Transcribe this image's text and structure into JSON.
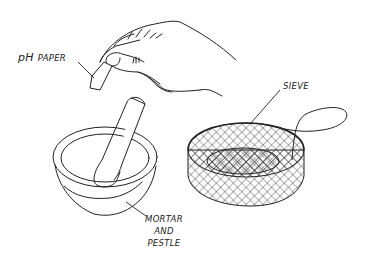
{
  "figure": {
    "type": "line-art illustration",
    "colors": {
      "ink": "#222222",
      "background": "#ffffff"
    },
    "items": [
      {
        "id": "ph-paper",
        "label_prefix": "pH",
        "label_rest": "Paper",
        "icon": "hand-holding-paper-strip"
      },
      {
        "id": "sieve",
        "label": "Sieve",
        "icon": "mesh-sieve-with-handle"
      },
      {
        "id": "mortar-and-pestle",
        "label_lines": [
          "Mortar",
          "and",
          "Pestle"
        ],
        "icon": "mortar-bowl-with-pestle"
      }
    ]
  }
}
